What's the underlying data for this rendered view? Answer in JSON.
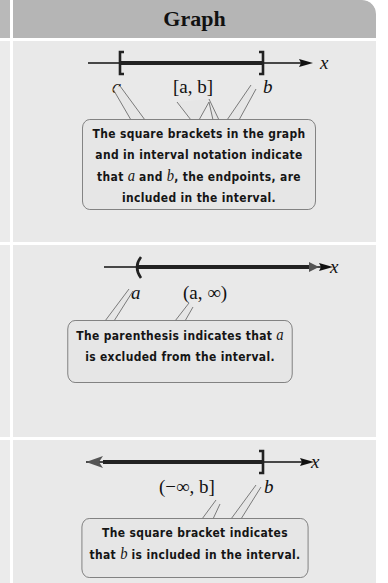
{
  "header": {
    "title": "Graph"
  },
  "rows": [
    {
      "interval": "[a, b]",
      "left_label": "a",
      "right_label": "b",
      "axis_label": "x",
      "left_endpoint": "[",
      "right_endpoint": "]",
      "callout": {
        "line1": "The square brackets in the graph",
        "line2": "and in interval notation indicate",
        "line3_pre": "that ",
        "var_a": "a",
        "line3_mid": " and ",
        "var_b": "b",
        "line3_post": ", the endpoints, are",
        "line4": "included in the interval."
      }
    },
    {
      "interval": "(a, ∞)",
      "left_label": "a",
      "axis_label": "x",
      "left_endpoint": "(",
      "callout": {
        "line1_pre": "The parenthesis indicates that ",
        "var_a": "a",
        "line2": "is excluded from the interval."
      }
    },
    {
      "interval": "(−∞, b]",
      "right_label": "b",
      "axis_label": "x",
      "right_endpoint": "]",
      "callout": {
        "line1": "The square bracket indicates",
        "line2_pre": "that ",
        "var_b": "b",
        "line2_post": " is included in the interval."
      }
    }
  ],
  "colors": {
    "header_bg": "#b5b5b5",
    "panel_bg": "#e9e9e9",
    "callout_border": "#7a7a7a",
    "line": "#111111"
  }
}
